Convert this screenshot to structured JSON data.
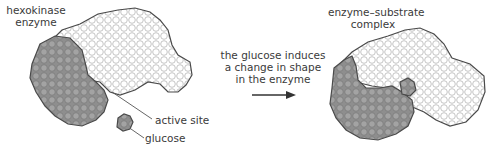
{
  "left_panel": {
    "title_line1": "hexokinase",
    "title_line2": "enzyme",
    "label_active_site": "active site",
    "label_glucose": "glucose"
  },
  "arrow": {
    "line1": "the glucose induces",
    "line2": "a change in shape",
    "line3": "in the enzyme"
  },
  "right_panel": {
    "title_line1": "enzyme–substrate",
    "title_line2": "complex"
  },
  "colors": {
    "dark_domain": "#9a9a9a",
    "light_domain": "#ffffff",
    "outline": "#4a4a4a"
  }
}
